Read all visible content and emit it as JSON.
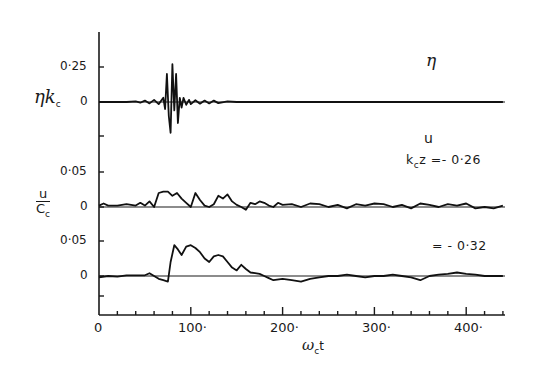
{
  "chart_data": {
    "type": "line",
    "title": "",
    "xlabel": "ωct",
    "x_ticks": [
      "0",
      "100",
      "200",
      "300",
      "400"
    ],
    "xlim": [
      0,
      440
    ],
    "grid": false,
    "panels": [
      {
        "name": "surface elevation",
        "ylabel": "ηkc",
        "annotation": "η",
        "y_ticks": [
          "0·25",
          "0"
        ],
        "ylim": [
          -0.25,
          0.4
        ],
        "series": [
          {
            "name": "η",
            "x": [
              0,
              30,
              40,
              45,
              50,
              55,
              60,
              65,
              70,
              72,
              74,
              76,
              78,
              80,
              82,
              84,
              86,
              88,
              90,
              92,
              95,
              98,
              100,
              105,
              110,
              115,
              120,
              125,
              130,
              140,
              150,
              200,
              300,
              440
            ],
            "y": [
              0,
              0,
              0.005,
              -0.005,
              0.01,
              -0.01,
              0.015,
              -0.015,
              0.03,
              -0.05,
              0.2,
              -0.1,
              -0.22,
              0.27,
              -0.06,
              0.2,
              -0.15,
              0.03,
              -0.04,
              0.03,
              -0.02,
              0.015,
              -0.015,
              0.012,
              -0.012,
              0.01,
              -0.01,
              0.01,
              -0.008,
              0.005,
              0,
              0,
              0,
              0
            ]
          }
        ]
      },
      {
        "name": "velocity kcz=-0.26",
        "ylabel": "u/Cc",
        "annotation": "u  kcz = -0·26",
        "y_ticks": [
          "0·05",
          "0"
        ],
        "ylim": [
          -0.02,
          0.07
        ],
        "series": [
          {
            "name": "u (kcz=-0.26)",
            "x": [
              0,
              5,
              10,
              20,
              30,
              40,
              45,
              50,
              55,
              60,
              65,
              70,
              75,
              80,
              85,
              90,
              95,
              100,
              105,
              110,
              115,
              120,
              125,
              130,
              135,
              140,
              145,
              150,
              155,
              160,
              165,
              170,
              175,
              180,
              185,
              190,
              195,
              200,
              210,
              220,
              230,
              240,
              250,
              260,
              270,
              280,
              290,
              300,
              310,
              320,
              330,
              340,
              350,
              360,
              370,
              380,
              390,
              400,
              410,
              420,
              430,
              440
            ],
            "y": [
              0.002,
              0.005,
              0.002,
              0.002,
              0.004,
              0.002,
              0.006,
              0.002,
              0.008,
              0,
              0.02,
              0.022,
              0.022,
              0.016,
              0.02,
              0.012,
              0.006,
              0.0,
              0.02,
              0.01,
              0.002,
              0.0,
              0.004,
              0.016,
              0.012,
              0.018,
              0.008,
              0.003,
              0.0,
              -0.004,
              0.006,
              0.004,
              0.008,
              0.006,
              0.002,
              0.0,
              0.006,
              0.003,
              0.004,
              0.0,
              0.005,
              0.004,
              0.0,
              0.003,
              -0.002,
              0.004,
              0.002,
              0.005,
              0.004,
              0.0,
              0.003,
              -0.002,
              0.005,
              0.003,
              0.0,
              0.004,
              0.002,
              0.005,
              -0.002,
              0.0,
              -0.002,
              0.002
            ]
          }
        ]
      },
      {
        "name": "velocity kcz=-0.32",
        "ylabel": "",
        "annotation": "= -0·32",
        "y_ticks": [
          "0·05",
          "0"
        ],
        "ylim": [
          -0.02,
          0.07
        ],
        "series": [
          {
            "name": "u (kcz=-0.32)",
            "x": [
              0,
              10,
              20,
              30,
              40,
              50,
              55,
              60,
              65,
              70,
              75,
              78,
              82,
              86,
              90,
              95,
              100,
              105,
              110,
              115,
              120,
              125,
              130,
              135,
              140,
              145,
              150,
              155,
              160,
              165,
              170,
              175,
              180,
              185,
              190,
              200,
              210,
              220,
              230,
              240,
              250,
              260,
              270,
              280,
              290,
              300,
              310,
              320,
              330,
              340,
              350,
              360,
              370,
              380,
              390,
              400,
              410,
              420,
              430,
              440
            ],
            "y": [
              -0.002,
              0.0,
              -0.001,
              0.001,
              0.001,
              0.001,
              0.004,
              0.0,
              -0.004,
              -0.006,
              -0.008,
              0.02,
              0.044,
              0.038,
              0.03,
              0.042,
              0.044,
              0.04,
              0.034,
              0.025,
              0.02,
              0.028,
              0.03,
              0.028,
              0.02,
              0.012,
              0.008,
              0.016,
              0.01,
              0.005,
              0.004,
              0.003,
              0.0,
              -0.003,
              -0.006,
              -0.004,
              -0.006,
              -0.008,
              -0.004,
              -0.002,
              0.0,
              0.0,
              0.002,
              0.0,
              -0.002,
              0.0,
              0.0,
              0.002,
              0.0,
              -0.002,
              -0.006,
              0.0,
              0.002,
              0.003,
              0.005,
              0.003,
              0.002,
              0.0,
              0.0,
              0.0
            ]
          }
        ]
      }
    ]
  },
  "labels": {
    "panel1_ylabel_main": "ηk",
    "panel1_ylabel_sub": "c",
    "panel1_tick_top": "0·25",
    "panel1_tick_zero": "0",
    "panel1_annotation": "η",
    "panel2_ylabel_num": "u",
    "panel2_ylabel_den": "C",
    "panel2_ylabel_den_sub": "c",
    "panel2_tick_top": "0·05",
    "panel2_tick_zero": "0",
    "panel2_annotation_u": "u",
    "panel2_annotation_k": "k",
    "panel2_annotation_k_sub": "c",
    "panel2_annotation_rest": "z =- 0·26",
    "panel3_tick_top": "0·05",
    "panel3_tick_zero": "0",
    "panel3_annotation": "= - 0·32",
    "x_tick_0": "0",
    "x_tick_100": "100·",
    "x_tick_200": "200·",
    "x_tick_300": "300·",
    "x_tick_400": "400·",
    "xlabel_main": "ω",
    "xlabel_sub": "c",
    "xlabel_t": "t"
  }
}
